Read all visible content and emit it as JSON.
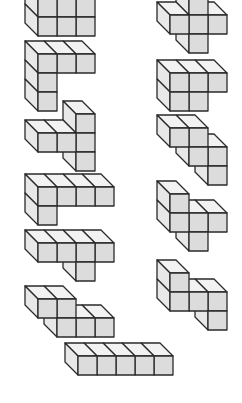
{
  "diagram": {
    "title": "",
    "cube": {
      "size": 19,
      "dx": -13,
      "dy": -13
    },
    "colors": {
      "front": "#dcdcdc",
      "top": "#f2f2f2",
      "side": "#e8e8e8",
      "stroke": "#2a2a2a",
      "background": "#ffffff"
    },
    "pieces": [
      {
        "id": "piece-1",
        "cubes": [
          [
            38,
            -21,
            0
          ],
          [
            57,
            -21,
            0
          ],
          [
            76,
            -21,
            0
          ],
          [
            38,
            -2,
            0
          ],
          [
            57,
            -2,
            0
          ],
          [
            76,
            -2,
            0
          ],
          [
            38,
            17,
            0
          ],
          [
            57,
            17,
            0
          ],
          [
            76,
            17,
            0
          ]
        ],
        "note": "top-left, partially cropped"
      },
      {
        "id": "piece-2",
        "cubes": [
          [
            38,
            92,
            0
          ],
          [
            38,
            73,
            0
          ],
          [
            38,
            54,
            0
          ],
          [
            57,
            54,
            0
          ],
          [
            76,
            54,
            0
          ]
        ]
      },
      {
        "id": "piece-3",
        "cubes": [
          [
            76,
            152,
            0
          ],
          [
            38,
            133,
            0
          ],
          [
            57,
            133,
            0
          ],
          [
            76,
            133,
            0
          ],
          [
            76,
            114,
            0
          ]
        ]
      },
      {
        "id": "piece-4",
        "cubes": [
          [
            38,
            206,
            0
          ],
          [
            38,
            187,
            0
          ],
          [
            57,
            187,
            0
          ],
          [
            76,
            187,
            0
          ],
          [
            95,
            187,
            0
          ]
        ]
      },
      {
        "id": "piece-5",
        "cubes": [
          [
            76,
            262,
            0
          ],
          [
            38,
            243,
            0
          ],
          [
            57,
            243,
            0
          ],
          [
            76,
            243,
            0
          ],
          [
            95,
            243,
            0
          ]
        ]
      },
      {
        "id": "piece-6",
        "cubes": [
          [
            57,
            318,
            0
          ],
          [
            76,
            318,
            0
          ],
          [
            95,
            318,
            0
          ],
          [
            38,
            299,
            0
          ],
          [
            57,
            299,
            0
          ]
        ]
      },
      {
        "id": "piece-7",
        "cubes": [
          [
            78,
            356,
            0
          ],
          [
            97,
            356,
            0
          ],
          [
            116,
            356,
            0
          ],
          [
            135,
            356,
            0
          ],
          [
            154,
            356,
            0
          ]
        ]
      },
      {
        "id": "piece-8",
        "cubes": [
          [
            189,
            34,
            0
          ],
          [
            170,
            15,
            0
          ],
          [
            189,
            15,
            0
          ],
          [
            208,
            15,
            0
          ],
          [
            189,
            -4,
            0
          ]
        ]
      },
      {
        "id": "piece-9",
        "cubes": [
          [
            170,
            92,
            0
          ],
          [
            189,
            92,
            0
          ],
          [
            170,
            73,
            0
          ],
          [
            189,
            73,
            0
          ],
          [
            208,
            73,
            0
          ]
        ]
      },
      {
        "id": "piece-10",
        "cubes": [
          [
            208,
            166,
            0
          ],
          [
            189,
            147,
            0
          ],
          [
            208,
            147,
            0
          ],
          [
            170,
            128,
            0
          ],
          [
            189,
            128,
            0
          ]
        ]
      },
      {
        "id": "piece-11",
        "cubes": [
          [
            189,
            232,
            0
          ],
          [
            170,
            213,
            0
          ],
          [
            189,
            213,
            0
          ],
          [
            208,
            213,
            0
          ],
          [
            170,
            194,
            0
          ]
        ]
      },
      {
        "id": "piece-12",
        "cubes": [
          [
            208,
            311,
            0
          ],
          [
            170,
            292,
            0
          ],
          [
            189,
            292,
            0
          ],
          [
            208,
            292,
            0
          ],
          [
            170,
            273,
            0
          ]
        ]
      }
    ]
  }
}
